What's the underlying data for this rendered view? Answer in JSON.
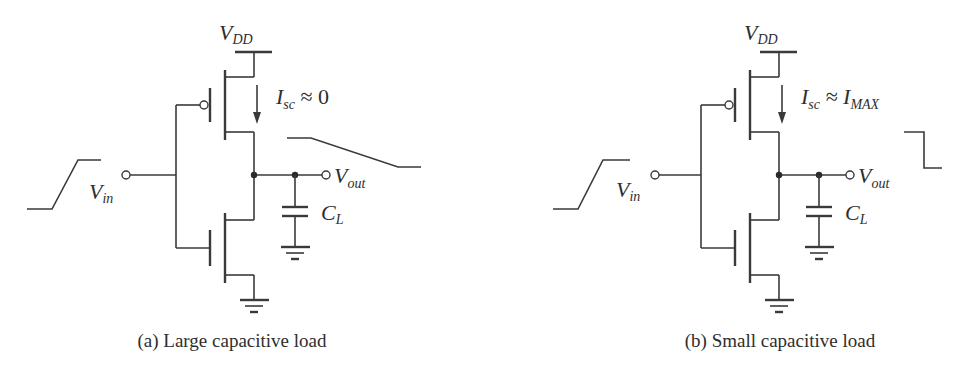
{
  "figure": {
    "panels": [
      {
        "id": "a",
        "caption": "(a) Large capacitive load",
        "supply_label": "V",
        "supply_sub": "DD",
        "current_label": "I",
        "current_sub": "sc",
        "current_value": " ≈ 0",
        "current_value_sub": "",
        "input_label": "V",
        "input_sub": "in",
        "output_label": "V",
        "output_sub": "out",
        "cap_label": "C",
        "cap_sub": "L",
        "output_waveform": "slow falling ramp"
      },
      {
        "id": "b",
        "caption": "(b) Small capacitive load",
        "supply_label": "V",
        "supply_sub": "DD",
        "current_label": "I",
        "current_sub": "sc",
        "current_value": " ≈ I",
        "current_value_sub": "MAX",
        "input_label": "V",
        "input_sub": "in",
        "output_label": "V",
        "output_sub": "out",
        "cap_label": "C",
        "cap_sub": "L",
        "output_waveform": "fast falling step"
      }
    ],
    "colors": {
      "ink": "#3a3a3a",
      "background": "#ffffff"
    }
  }
}
